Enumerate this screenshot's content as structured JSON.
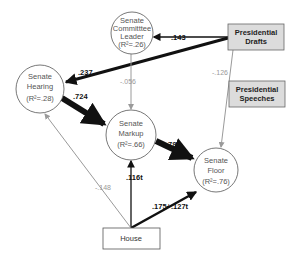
{
  "nodes": {
    "committee_leader": {
      "line1": "Senate",
      "line2": "Committtee",
      "line3": "Leader",
      "r2": "(R²=.26)"
    },
    "hearing": {
      "line1": "Senate",
      "line2": "Hearing",
      "r2": "(R²=.28)"
    },
    "markup": {
      "line1": "Senate",
      "line2": "Markup",
      "r2": "(R²=.66)"
    },
    "floor": {
      "line1": "Senate",
      "line2": "Floor",
      "r2": "(R²=.76)"
    },
    "drafts": {
      "line1": "Presidential",
      "line2": "Drafts"
    },
    "speeches": {
      "line1": "Presidential",
      "line2": "Speeches"
    },
    "house": {
      "label": "House"
    }
  },
  "edges": {
    "drafts_to_leader": ".143",
    "drafts_to_hearing": ".237",
    "drafts_to_floor": "-.126",
    "leader_to_markup": "-.056",
    "hearing_to_markup": ".724",
    "markup_to_floor": ".781",
    "house_to_markup": ".116t",
    "house_to_floor": ".175+.127t",
    "house_to_hearing": "-.148"
  },
  "colors": {
    "box_fill": "#dcdcdc",
    "strong_edge": "#111111",
    "weak_edge": "#9a9a9a"
  }
}
